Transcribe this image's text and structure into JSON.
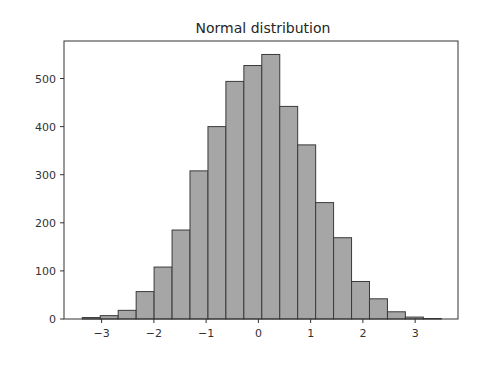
{
  "chart_data": {
    "type": "bar",
    "subtype": "histogram",
    "title": "Normal distribution",
    "xlabel": "",
    "ylabel": "",
    "bins": 20,
    "bin_edges": [
      -3.37,
      -3.026,
      -2.683,
      -2.339,
      -1.996,
      -1.652,
      -1.309,
      -0.965,
      -0.622,
      -0.278,
      0.065,
      0.409,
      0.752,
      1.096,
      1.439,
      1.783,
      2.126,
      2.47,
      2.813,
      3.157,
      3.5
    ],
    "values": [
      3,
      7,
      18,
      57,
      108,
      185,
      308,
      400,
      494,
      527,
      550,
      442,
      362,
      242,
      169,
      78,
      42,
      15,
      4,
      1
    ],
    "xlim": [
      -3.72,
      3.82
    ],
    "ylim": [
      0,
      578
    ],
    "x_ticks": [
      -3,
      -2,
      -1,
      0,
      1,
      2,
      3
    ],
    "x_tick_labels": [
      "−3",
      "−2",
      "−1",
      "0",
      "1",
      "2",
      "3"
    ],
    "y_ticks": [
      0,
      100,
      200,
      300,
      400,
      500
    ],
    "y_tick_labels": [
      "0",
      "100",
      "200",
      "300",
      "400",
      "500"
    ],
    "grid": false,
    "legend": null,
    "colors": {
      "bar_fill": "#a6a6a6",
      "bar_edge": "#3a3a3a",
      "axes": "#333333"
    }
  }
}
